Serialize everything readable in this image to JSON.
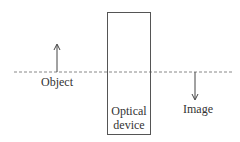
{
  "diagram": {
    "type": "optics-schematic",
    "labels": {
      "object": "Object",
      "image": "Image",
      "device_line1": "Optical",
      "device_line2": "device"
    },
    "elements": {
      "optical_axis": {
        "style": "dashed",
        "x1": 14,
        "x2": 232,
        "y": 72
      },
      "object_arrow": {
        "direction": "up",
        "x": 57,
        "y_base": 72,
        "y_tip": 44
      },
      "image_arrow": {
        "direction": "down",
        "x": 195,
        "y_base": 72,
        "y_tip": 100
      },
      "device_box": {
        "x": 107,
        "y": 12,
        "width": 43,
        "height": 122
      }
    },
    "colors": {
      "stroke": "#555555",
      "axis": "#888888",
      "text": "#333333"
    }
  }
}
